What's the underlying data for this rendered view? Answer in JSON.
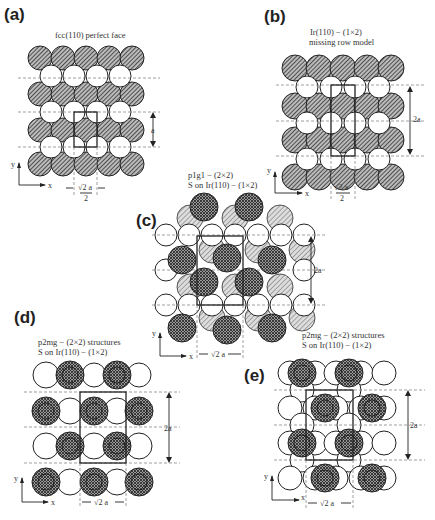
{
  "figure": {
    "panels": [
      {
        "id": "a",
        "label": "(a)",
        "caption_lines": [
          "fcc(110) perfect face"
        ],
        "vertical_dim": "a",
        "horizontal_dim_num": "√2 a",
        "horizontal_dim_den": "2"
      },
      {
        "id": "b",
        "label": "(b)",
        "caption_lines": [
          "Ir(110) − (1×2)",
          "missing row model"
        ],
        "vertical_dim": "2a",
        "horizontal_dim_num": "√2 a",
        "horizontal_dim_den": "2"
      },
      {
        "id": "c",
        "label": "(c)",
        "caption_lines": [
          "p1g1 − (2×2)",
          "S on Ir(110) − (1×2)"
        ],
        "vertical_dim": "2a",
        "horizontal_dim": "√2 a"
      },
      {
        "id": "d",
        "label": "(d)",
        "caption_lines": [
          "p2mg − (2×2) structures",
          "S on Ir(110) − (1×2)"
        ],
        "vertical_dim": "2a",
        "horizontal_dim": "√2 a"
      },
      {
        "id": "e",
        "label": "(e)",
        "caption_lines": [
          "p2mg − (2×2) structures",
          "S on Ir(110) − (1×2)"
        ],
        "vertical_dim": "2a",
        "horizontal_dim": "√2 a"
      }
    ],
    "axes": {
      "x_label": "x",
      "y_label": "y"
    },
    "legend_colors": {
      "substrate_top": "#555555",
      "substrate_second": "#ffffff",
      "sulfur_adsorbate": "#444444"
    }
  }
}
